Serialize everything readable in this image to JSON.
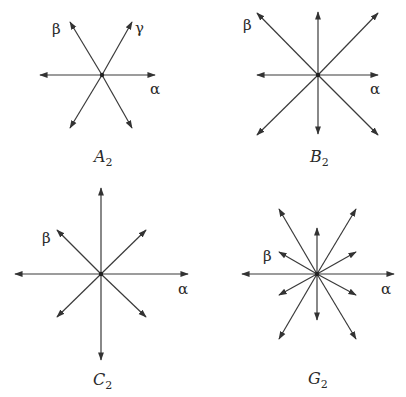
{
  "figure": {
    "panels": [
      {
        "id": "A2",
        "caption": {
          "letter": "A",
          "sub": "2",
          "x": 94,
          "y": 162
        },
        "center": [
          102,
          75
        ],
        "vectors": [
          [
            155,
            75
          ],
          [
            40,
            75
          ],
          [
            132,
            22
          ],
          [
            70,
            22
          ],
          [
            132,
            128
          ],
          [
            70,
            128
          ]
        ],
        "labels": [
          {
            "text": "β",
            "x": 52,
            "y": 34
          },
          {
            "text": "γ",
            "x": 135,
            "y": 33
          },
          {
            "text": "α",
            "x": 150,
            "y": 94
          }
        ]
      },
      {
        "id": "B2",
        "caption": {
          "letter": "B",
          "sub": "2",
          "x": 310,
          "y": 162
        },
        "center": [
          318,
          75
        ],
        "vectors": [
          [
            378,
            75
          ],
          [
            257,
            75
          ],
          [
            318,
            12
          ],
          [
            318,
            134
          ],
          [
            378,
            13
          ],
          [
            257,
            13
          ],
          [
            378,
            135
          ],
          [
            257,
            135
          ]
        ],
        "labels": [
          {
            "text": "β",
            "x": 243,
            "y": 30
          },
          {
            "text": "α",
            "x": 370,
            "y": 94
          }
        ]
      },
      {
        "id": "C2",
        "caption": {
          "letter": "C",
          "sub": "2",
          "x": 93,
          "y": 385
        },
        "center": [
          101,
          274
        ],
        "vectors": [
          [
            188,
            274
          ],
          [
            15,
            274
          ],
          [
            101,
            188
          ],
          [
            101,
            360
          ],
          [
            146,
            230
          ],
          [
            57,
            230
          ],
          [
            146,
            317
          ],
          [
            57,
            317
          ]
        ],
        "labels": [
          {
            "text": "β",
            "x": 42,
            "y": 243
          },
          {
            "text": "α",
            "x": 178,
            "y": 294
          }
        ]
      },
      {
        "id": "G2",
        "caption": {
          "letter": "G",
          "sub": "2",
          "x": 308,
          "y": 384
        },
        "center": [
          317,
          274
        ],
        "vectors": [
          [
            394,
            274
          ],
          [
            242,
            274
          ],
          [
            317,
            228
          ],
          [
            317,
            320
          ],
          [
            356,
            209
          ],
          [
            279,
            209
          ],
          [
            356,
            339
          ],
          [
            279,
            339
          ],
          [
            356,
            252
          ],
          [
            279,
            252
          ],
          [
            356,
            295
          ],
          [
            279,
            295
          ]
        ],
        "labels": [
          {
            "text": "β",
            "x": 263,
            "y": 261
          },
          {
            "text": "α",
            "x": 381,
            "y": 294
          }
        ]
      }
    ]
  }
}
